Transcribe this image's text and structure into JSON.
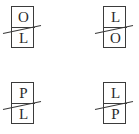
{
  "figure": {
    "background_color": "#ffffff",
    "stroke_color": "#3b3b3b",
    "text_color": "#2b2b2b",
    "grid": {
      "rows": 2,
      "columns": 4
    },
    "tokens": [
      {
        "id": "token-top-left",
        "position": "top-left",
        "top_letter": "O",
        "bottom_letter": "L",
        "struck_through": true,
        "slash_direction": "upward-right"
      },
      {
        "id": "token-top-right",
        "position": "top-right",
        "top_letter": "L",
        "bottom_letter": "O",
        "struck_through": true,
        "slash_direction": "upward-right"
      },
      {
        "id": "token-bottom-left",
        "position": "bottom-left",
        "top_letter": "P",
        "bottom_letter": "L",
        "struck_through": true,
        "slash_direction": "upward-right"
      },
      {
        "id": "token-bottom-right",
        "position": "bottom-right",
        "top_letter": "L",
        "bottom_letter": "P",
        "struck_through": true,
        "slash_direction": "upward-right"
      }
    ]
  }
}
